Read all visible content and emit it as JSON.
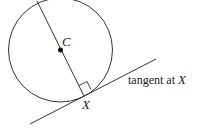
{
  "diagram": {
    "center_label": "C",
    "point_label": "X",
    "tangent_label_text": "tangent at ",
    "tangent_label_point": "X",
    "stroke_color": "#333333"
  }
}
